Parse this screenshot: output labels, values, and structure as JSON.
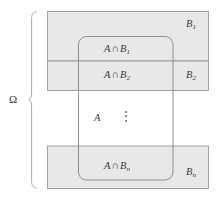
{
  "figure": {
    "kind": "set-partition-venn-diagram",
    "sample_space_label": "Ω",
    "brace": "left-curly-brace",
    "event_a_label": "A",
    "vertical_ellipsis": "⋮",
    "partition_blocks": [
      {
        "name": "block-b1",
        "set_label_html": "B<sub>1</sub>",
        "set_label_text": "B1",
        "intersection_label_html": "A<span class=\"op\">∩</span>B<sub>1</sub>",
        "intersection_label_text": "A ∩ B1"
      },
      {
        "name": "block-b2",
        "set_label_html": "B<sub>2</sub>",
        "set_label_text": "B2",
        "intersection_label_html": "A<span class=\"op\">∩</span>B<sub>2</sub>",
        "intersection_label_text": "A ∩ B2"
      },
      {
        "name": "block-bn",
        "set_label_html": "B<sub>n</sub>",
        "set_label_text": "Bn",
        "intersection_label_html": "A<span class=\"op\">∩</span>B<sub>n</sub>",
        "intersection_label_text": "A ∩ Bn"
      }
    ],
    "colors": {
      "block_fill": "#e8e8e8",
      "block_stroke": "#9a9a9a",
      "set_a_stroke": "#8f8f8f",
      "brace_stroke": "#a8a8a8",
      "page_background": "#ffffff",
      "text": "#3a3a3a"
    },
    "geometry": {
      "canvas": [
        218,
        202
      ],
      "blocks_x": [
        47,
        209
      ],
      "b1_y": [
        11,
        61
      ],
      "b2_y": [
        61,
        90
      ],
      "bn_y": [
        146,
        188
      ],
      "set_a_rect": [
        78,
        36,
        173,
        180
      ],
      "set_a_corner_radius": 8,
      "brace_x": [
        30,
        37
      ],
      "brace_y": [
        11,
        188
      ]
    }
  }
}
